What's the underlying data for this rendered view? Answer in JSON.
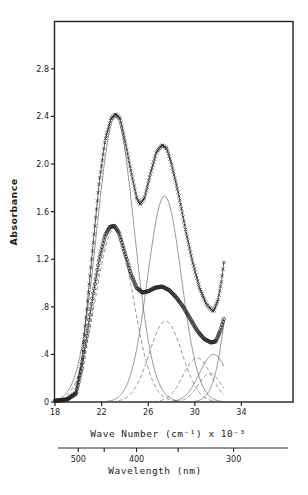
{
  "chart_data": {
    "type": "line",
    "title": "",
    "xlabel": "Wave Number (cm⁻¹) x 10⁻³",
    "ylabel": "Absorbance",
    "secondary_xlabel": "Wavelength (nm)",
    "xlim": [
      18,
      38.5
    ],
    "ylim": [
      0,
      3.25
    ],
    "x_ticks": [
      18,
      22,
      26,
      30,
      34
    ],
    "x_tick_labels": [
      "18",
      "22",
      "26",
      "30",
      "34"
    ],
    "y_ticks": [
      0,
      0.4,
      0.8,
      1.2,
      1.6,
      2.0,
      2.4,
      2.8
    ],
    "y_tick_labels": [
      "0",
      ".4",
      ".8",
      "1.2",
      "1.6",
      "2.0",
      "2.4",
      "2.8"
    ],
    "secondary_x_ticks_nm": [
      500,
      450,
      400,
      350,
      300
    ],
    "secondary_x_tick_labels": [
      "500",
      "",
      "400",
      "",
      "300"
    ],
    "grid": false,
    "legend": null,
    "series": [
      {
        "name": "Spectrum 1 (upper, x markers)",
        "style": "x-markers",
        "x": [
          18,
          19,
          19.8,
          20.3,
          20.8,
          21.3,
          21.8,
          22.3,
          22.8,
          23.2,
          23.6,
          24.0,
          24.5,
          25.0,
          25.3,
          25.7,
          26.2,
          26.7,
          27.2,
          27.6,
          28.0,
          28.6,
          29.2,
          29.8,
          30.4,
          31.0,
          31.6,
          32.0,
          32.3,
          32.5
        ],
        "y": [
          0.01,
          0.02,
          0.08,
          0.35,
          0.85,
          1.35,
          1.85,
          2.2,
          2.38,
          2.42,
          2.38,
          2.2,
          1.95,
          1.72,
          1.66,
          1.72,
          1.92,
          2.1,
          2.16,
          2.13,
          2.0,
          1.75,
          1.45,
          1.18,
          0.96,
          0.82,
          0.76,
          0.86,
          1.02,
          1.18
        ]
      },
      {
        "name": "Spectrum 2 (lower, o markers)",
        "style": "o-markers",
        "x": [
          18,
          19,
          19.8,
          20.3,
          20.8,
          21.3,
          21.8,
          22.3,
          22.7,
          23.1,
          23.5,
          24.0,
          24.5,
          25.0,
          25.5,
          26.0,
          26.6,
          27.2,
          27.8,
          28.4,
          29.0,
          29.6,
          30.2,
          30.8,
          31.4,
          31.8,
          32.2,
          32.5
        ],
        "y": [
          0.01,
          0.02,
          0.07,
          0.28,
          0.6,
          0.92,
          1.2,
          1.4,
          1.47,
          1.48,
          1.42,
          1.25,
          1.08,
          0.96,
          0.92,
          0.93,
          0.96,
          0.97,
          0.94,
          0.88,
          0.8,
          0.7,
          0.6,
          0.53,
          0.5,
          0.51,
          0.6,
          0.7
        ]
      }
    ],
    "components": [
      {
        "name": "band A (solid)",
        "style": "solid",
        "center": 23.2,
        "amplitude": 2.4,
        "width": 1.6
      },
      {
        "name": "band B (solid)",
        "style": "solid",
        "center": 27.4,
        "amplitude": 1.73,
        "width": 1.45
      },
      {
        "name": "band C (solid)",
        "style": "solid",
        "center": 31.6,
        "amplitude": 0.4,
        "width": 1.2
      },
      {
        "name": "band D (solid)",
        "style": "solid",
        "center": 34.5,
        "amplitude": 2.2,
        "width": 1.3
      },
      {
        "name": "band E (dashed)",
        "style": "dashed",
        "center": 23.1,
        "amplitude": 1.46,
        "width": 1.6
      },
      {
        "name": "band F (dashed)",
        "style": "dashed",
        "center": 27.5,
        "amplitude": 0.68,
        "width": 1.4
      },
      {
        "name": "band G (dashed)",
        "style": "dashed",
        "center": 30.2,
        "amplitude": 0.37,
        "width": 1.2
      },
      {
        "name": "band H (dashed)",
        "style": "dashed",
        "center": 31.3,
        "amplitude": 0.24,
        "width": 1.0
      }
    ]
  }
}
